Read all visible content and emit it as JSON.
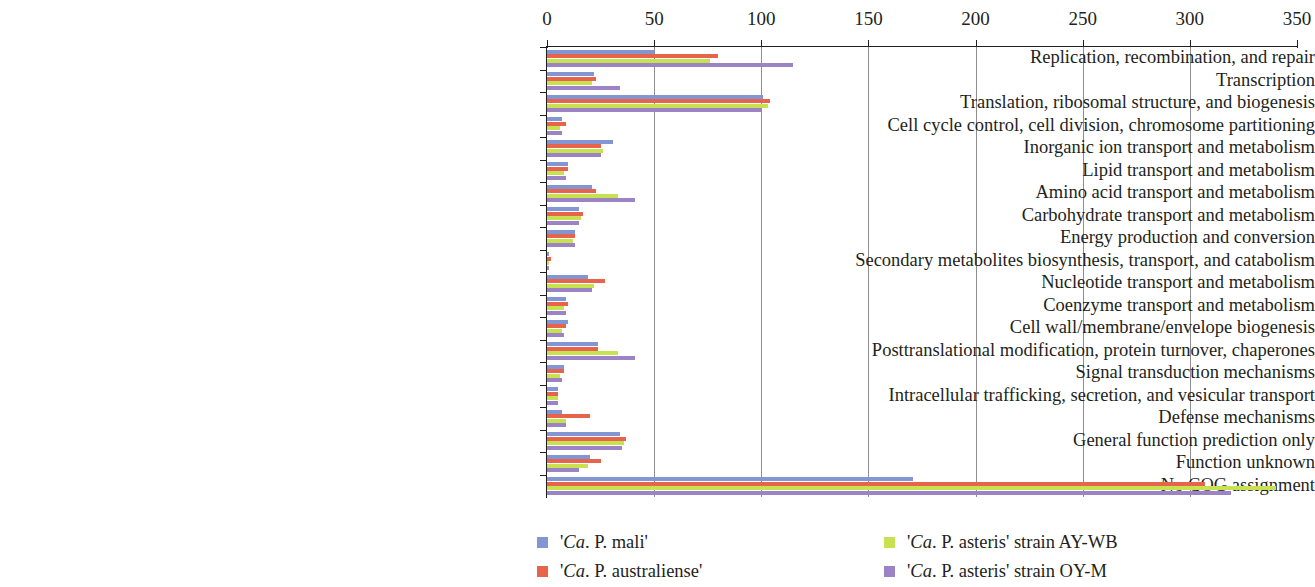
{
  "chart_data": {
    "type": "bar",
    "orientation": "horizontal",
    "title": "",
    "subtitle": "",
    "xlabel": "",
    "ylabel": "",
    "xlim": [
      0,
      350
    ],
    "xticks": [
      0,
      50,
      100,
      150,
      200,
      250,
      300,
      350
    ],
    "grid": true,
    "legend_position": "bottom",
    "categories": [
      "Replication, recombination, and repair",
      "Transcription",
      "Translation, ribosomal structure, and biogenesis",
      "Cell cycle control, cell division, chromosome partitioning",
      "Inorganic ion transport and metabolism",
      "Lipid transport and metabolism",
      "Amino acid transport and metabolism",
      "Carbohydrate transport and metabolism",
      "Energy production and conversion",
      "Secondary metabolites biosynthesis, transport, and catabolism",
      "Nucleotide transport and metabolism",
      "Coenzyme transport and metabolism",
      "Cell wall/membrane/envelope biogenesis",
      "Posttranslational modification, protein turnover, chaperones",
      "Signal transduction mechanisms",
      "Intracellular trafficking, secretion, and vesicular transport",
      "Defense mechanisms",
      "General function prediction only",
      "Function unknown",
      "No COG assignment"
    ],
    "series": [
      {
        "name": "'Ca. P. mali'",
        "color": "#8196d2",
        "values": [
          50,
          22,
          101,
          7,
          31,
          10,
          21,
          15,
          13,
          1,
          19,
          9,
          10,
          24,
          8,
          5,
          7,
          34,
          20,
          171
        ]
      },
      {
        "name": "'Ca. P. australiense'",
        "color": "#e7634c",
        "values": [
          80,
          23,
          104,
          9,
          25,
          10,
          23,
          17,
          13,
          2,
          27,
          10,
          9,
          24,
          8,
          5,
          20,
          37,
          25,
          307
        ]
      },
      {
        "name": "'Ca. P. asteris' strain AY-WB",
        "color": "#c7e24e",
        "values": [
          76,
          21,
          103,
          6,
          26,
          8,
          33,
          16,
          12,
          1,
          22,
          8,
          7,
          33,
          6,
          5,
          9,
          36,
          19,
          340
        ]
      },
      {
        "name": "'Ca. P. asteris' strain OY-M",
        "color": "#9b83c6",
        "values": [
          115,
          34,
          100,
          7,
          25,
          9,
          41,
          15,
          13,
          1,
          21,
          9,
          8,
          41,
          7,
          5,
          9,
          35,
          15,
          319
        ]
      }
    ]
  },
  "legend": {
    "items": [
      {
        "prefix": "'",
        "italic": "Ca",
        "suffix": ". P. mali'",
        "series_index": 0
      },
      {
        "prefix": "'",
        "italic": "Ca",
        "suffix": ". P. australiense'",
        "series_index": 1
      },
      {
        "prefix": "'",
        "italic": "Ca",
        "suffix": ". P. asteris' strain AY-WB",
        "series_index": 2
      },
      {
        "prefix": "'",
        "italic": "Ca",
        "suffix": ". P. asteris' strain OY-M",
        "series_index": 3
      }
    ]
  }
}
